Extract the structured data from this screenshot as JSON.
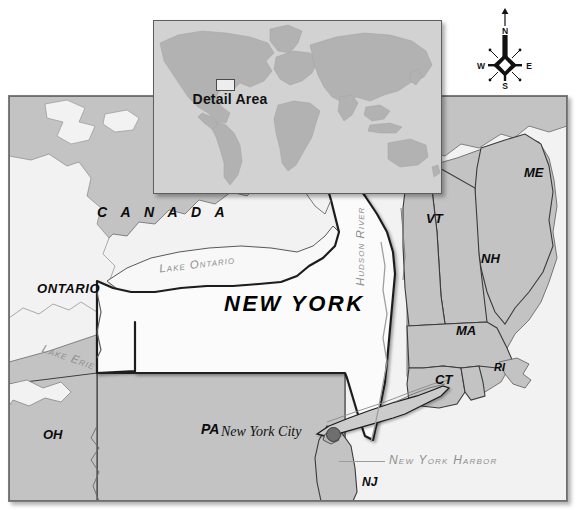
{
  "map": {
    "title": "New York State Reference Map",
    "colors": {
      "land": "#c3c3c3",
      "focus_state": "#fbfbfb",
      "water": "#f2f2f2",
      "inset_ocean": "#d2d2d2",
      "inset_land": "#b4b4b4",
      "border": "#3a3a3a",
      "water_label": "#8e8e8e",
      "city_marker": "#6e6e6e"
    },
    "focus_state": "NEW YORK",
    "labels": {
      "new_york": "NEW YORK",
      "canada": "C A N A D A",
      "ontario": "ONTARIO",
      "lake_ontario": "Lake Ontario",
      "lake_erie": "Lake Erie",
      "hudson_river": "Hudson River",
      "new_york_city": "New York City",
      "new_york_harbor": "New York Harbor"
    },
    "states": [
      {
        "abbr": "ME",
        "x": 524,
        "y": 173,
        "size": 13
      },
      {
        "abbr": "VT",
        "x": 428,
        "y": 220,
        "size": 13
      },
      {
        "abbr": "NH",
        "x": 482,
        "y": 259,
        "size": 13
      },
      {
        "abbr": "MA",
        "x": 458,
        "y": 331,
        "size": 13
      },
      {
        "abbr": "RI",
        "x": 497,
        "y": 369,
        "size": 11
      },
      {
        "abbr": "CT",
        "x": 437,
        "y": 380,
        "size": 13
      },
      {
        "abbr": "NJ",
        "x": 363,
        "y": 484,
        "size": 12
      },
      {
        "abbr": "PA",
        "x": 203,
        "y": 430,
        "size": 14
      },
      {
        "abbr": "OH",
        "x": 45,
        "y": 436,
        "size": 13
      }
    ]
  },
  "inset": {
    "name": "world-locator-map",
    "detail_area_label": "Detail Area"
  },
  "compass": {
    "name": "compass-rose",
    "north": "N",
    "east": "E",
    "south": "S",
    "west": "W"
  }
}
